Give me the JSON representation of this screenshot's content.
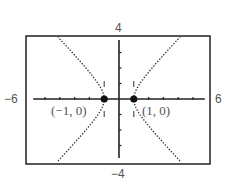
{
  "chart_data": {
    "type": "line",
    "title": "",
    "equation": "x^2 - y^2 = 1",
    "xlabel": "",
    "ylabel": "",
    "xlim": [
      -6,
      6
    ],
    "ylim": [
      -4,
      4
    ],
    "xscale": 1,
    "yscale": 1,
    "grid": false,
    "window_labels": {
      "xmin": "−6",
      "xmax": "6",
      "ymin": "−4",
      "ymax": "4"
    },
    "series": [
      {
        "name": "right branch",
        "style": "dotted",
        "points": [
          [
            4.12,
            4
          ],
          [
            3,
            2.83
          ],
          [
            2,
            1.73
          ],
          [
            1.5,
            1.12
          ],
          [
            1,
            0
          ],
          [
            1.5,
            -1.12
          ],
          [
            2,
            -1.73
          ],
          [
            3,
            -2.83
          ],
          [
            4.12,
            -4
          ]
        ]
      },
      {
        "name": "left branch",
        "style": "dotted",
        "points": [
          [
            -4.12,
            4
          ],
          [
            -3,
            2.83
          ],
          [
            -2,
            1.73
          ],
          [
            -1.5,
            1.12
          ],
          [
            -1,
            0
          ],
          [
            -1.5,
            -1.12
          ],
          [
            -2,
            -1.73
          ],
          [
            -3,
            -2.83
          ],
          [
            -4.12,
            -4
          ]
        ]
      }
    ],
    "annotations": [
      {
        "label": "(−1, 0)",
        "x": -1,
        "y": 0,
        "marker": "filled-circle"
      },
      {
        "label": "(1, 0)",
        "x": 1,
        "y": 0,
        "marker": "filled-circle"
      }
    ],
    "colors": {
      "frame": "#222222",
      "axis": "#222222",
      "curve": "#333333",
      "text": "#555555"
    }
  }
}
